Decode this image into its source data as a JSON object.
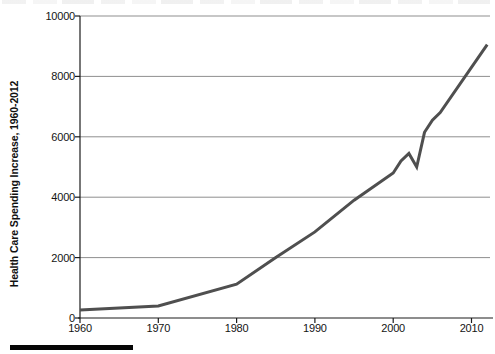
{
  "chart": {
    "y_axis_title": "Health Care Spending Increase, 1960-2012"
  },
  "chart_data": {
    "type": "line",
    "title": "",
    "xlabel": "",
    "ylabel": "Health Care Spending Increase, 1960-2012",
    "x_ticks": [
      1960,
      1970,
      1980,
      1990,
      2000,
      2010
    ],
    "y_ticks": [
      0,
      2000,
      4000,
      6000,
      8000,
      10000
    ],
    "xlim": [
      1960,
      2013
    ],
    "ylim": [
      0,
      10000
    ],
    "grid": "horizontal",
    "legend": "none",
    "series": [
      {
        "name": "health-care-spending",
        "color": "#4f4f4f",
        "points": [
          [
            1960,
            260
          ],
          [
            1970,
            400
          ],
          [
            1980,
            1120
          ],
          [
            1985,
            2000
          ],
          [
            1990,
            2850
          ],
          [
            1995,
            3900
          ],
          [
            2000,
            4800
          ],
          [
            2001,
            5200
          ],
          [
            2002,
            5450
          ],
          [
            2003,
            5000
          ],
          [
            2004,
            6150
          ],
          [
            2005,
            6550
          ],
          [
            2006,
            6800
          ],
          [
            2012,
            9050
          ]
        ]
      }
    ]
  },
  "colors": {
    "line": "#4f4f4f",
    "gridline": "#8f8f8f",
    "axis": "#1c1c1c",
    "text": "#141414",
    "bottom_bar": "#060606",
    "background": "#ffffff"
  }
}
